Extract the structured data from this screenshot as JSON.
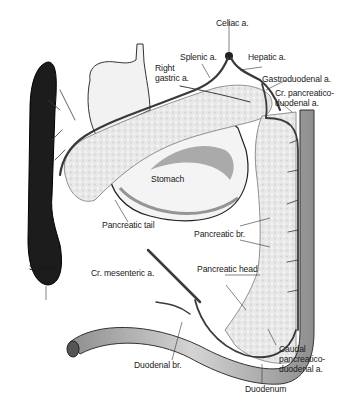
{
  "figure": {
    "type": "anatomical-diagram",
    "colors": {
      "background": "#ffffff",
      "spleen": "#1c1c1c",
      "stomach_fill": "#f2f2f2",
      "stomach_shade": "#8a8a8a",
      "pancreas_fill": "#e6e6e6",
      "artery": "#3a3a3a",
      "duodenum_fill": "#b5b5b5",
      "label": "#1a1a1a"
    },
    "labels": {
      "celiac": "Celiac a.",
      "splenic": "Splenic a.",
      "hepatic": "Hepatic a.",
      "right_gastric": "Right\ngastric a.",
      "gastroduodenal": "Gastroduodenal a.",
      "cr_pancreaticoduodenal": "Cr. pancreatico-\nduodenal a.",
      "stomach": "Stomach",
      "pancreatic_tail": "Pancreatic tail",
      "pancreatic_br": "Pancreatic br.",
      "spleen": "Spleen",
      "cr_mesenteric": "Cr. mesenteric a.",
      "pancreatic_head": "Pancreatic head",
      "caudal_pancreaticoduodenal": "Caudal\npancreatico-\nduodenal a.",
      "duodenal_br": "Duodenal br.",
      "duodenum": "Duodenum"
    }
  }
}
